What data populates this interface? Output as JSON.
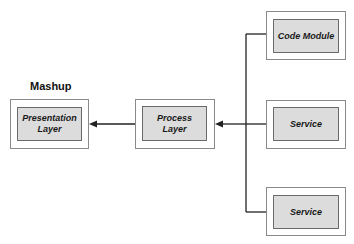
{
  "diagram": {
    "group_label": "Mashup",
    "nodes": [
      {
        "id": "presentation",
        "label": "Presentation Layer",
        "line1": "Presentation",
        "line2": "Layer"
      },
      {
        "id": "process",
        "label": "Process Layer",
        "line1": "Process",
        "line2": "Layer"
      },
      {
        "id": "code_module",
        "label": "Code Module"
      },
      {
        "id": "service_1",
        "label": "Service"
      },
      {
        "id": "service_2",
        "label": "Service"
      }
    ],
    "edges": [
      {
        "from": "process",
        "to": "presentation",
        "type": "arrow"
      },
      {
        "from": "code_module",
        "to": "process",
        "type": "arrow"
      },
      {
        "from": "service_1",
        "to": "process",
        "type": "arrow"
      },
      {
        "from": "service_2",
        "to": "process",
        "type": "arrow"
      }
    ],
    "colors": {
      "inner_fill": "#dcdcdc",
      "line": "#222222",
      "outer_border": "#8a8a8a"
    }
  }
}
